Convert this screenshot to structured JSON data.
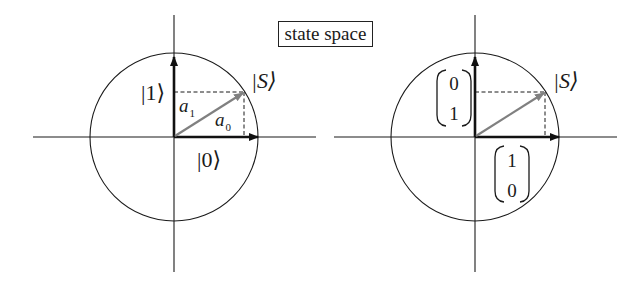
{
  "title": "state space",
  "colors": {
    "axis": "#1a1a1a",
    "basis_vector": "#111111",
    "state_vector": "#808080",
    "dashed": "#1a1a1a",
    "background": "#ffffff"
  },
  "left_diagram": {
    "state_label": "|S⟩",
    "basis_up_label": "|1⟩",
    "basis_right_label": "|0⟩",
    "amplitude_vertical": {
      "base": "a",
      "sub": "1"
    },
    "amplitude_horizontal": {
      "base": "a",
      "sub": "0"
    }
  },
  "right_diagram": {
    "state_label": "|S⟩",
    "basis_up_vector": [
      "0",
      "1"
    ],
    "basis_right_vector": [
      "1",
      "0"
    ]
  }
}
